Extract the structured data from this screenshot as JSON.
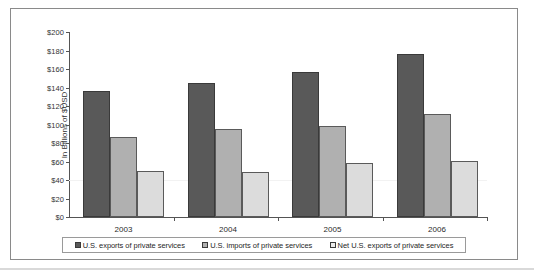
{
  "chart_data": {
    "type": "bar",
    "title": "",
    "subtitle": "",
    "xlabel": "",
    "ylabel": "In Billions of $USD",
    "categories": [
      "2003",
      "2004",
      "2005",
      "2006"
    ],
    "series": [
      {
        "name": "U.S. exports of private services",
        "color": "#595959",
        "values": [
          136,
          145,
          157,
          176
        ]
      },
      {
        "name": "U.S. imports of private services",
        "color": "#b0b0b0",
        "values": [
          86,
          95,
          98,
          111
        ]
      },
      {
        "name": "Net U.S. exports of private services",
        "color": "#ececec",
        "values": [
          50,
          49,
          58,
          61
        ]
      }
    ],
    "ylim": [
      0,
      200
    ],
    "ytick_values": [
      0,
      20,
      40,
      60,
      80,
      100,
      120,
      140,
      160,
      180,
      200
    ],
    "ytick_labels": [
      "$0",
      "$20",
      "$40",
      "$60",
      "$80",
      "$100",
      "$120",
      "$140",
      "$160",
      "$180",
      "$200"
    ],
    "grid": false,
    "legend_position": "bottom",
    "legend_entries": [
      "U.S. exports of private services",
      "U.S. imports of private services",
      "Net U.S. exports of private services"
    ]
  }
}
